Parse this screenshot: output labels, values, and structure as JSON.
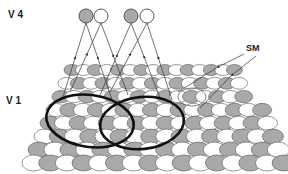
{
  "labels": {
    "v4": "V 4",
    "v1": "V 1",
    "sm": "SM"
  },
  "v4_neurons": [
    {
      "cx": 86,
      "cy": 16,
      "r": 7,
      "fill": "grey"
    },
    {
      "cx": 101,
      "cy": 16,
      "r": 7,
      "fill": "white"
    },
    {
      "cx": 131,
      "cy": 16,
      "r": 7,
      "fill": "white-grey"
    },
    {
      "cx": 147,
      "cy": 16,
      "r": 7,
      "fill": "white"
    }
  ],
  "colors": {
    "grey_unit": "#a9a9a9",
    "white_unit": "#ffffff",
    "stroke": "#555555",
    "rf_outline": "#111111",
    "background": "#ffffff"
  },
  "grid": {
    "rows": 8,
    "top_y": 70,
    "bottom_y": 163,
    "top_left_x": 64,
    "top_right_x": 232,
    "bottom_left_x": 22,
    "bottom_right_x": 282
  },
  "receptive_fields": [
    {
      "cx": 90,
      "cy": 121,
      "rx": 44,
      "ry": 26,
      "rot": 8
    },
    {
      "cx": 142,
      "cy": 123,
      "rx": 42,
      "ry": 26,
      "rot": -6
    }
  ],
  "sm_region": {
    "cx": 192,
    "cy": 97,
    "rx": 14,
    "ry": 9
  }
}
